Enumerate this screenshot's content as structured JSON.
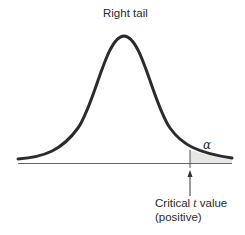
{
  "diagram": {
    "title": "Right tail",
    "distribution": "t",
    "shaded_region_label": "α",
    "critical_label_prefix": "Critical ",
    "critical_label_var": "t",
    "critical_label_suffix": " value",
    "critical_label_line2": "(positive)",
    "colors": {
      "curve": "#2b2b2b",
      "axis": "#555555",
      "shade": "#e8e8e8"
    }
  }
}
